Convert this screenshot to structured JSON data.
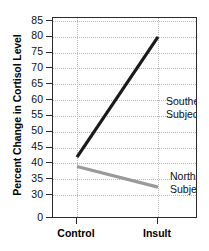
{
  "chart_data": {
    "type": "line",
    "title": "",
    "xlabel": "",
    "ylabel": "Percent Change in Cortisol Level",
    "categories": [
      "Control",
      "Insult"
    ],
    "series": [
      {
        "name": "Southern Subjects",
        "values": [
          42,
          80
        ],
        "color": "#1a1a1a"
      },
      {
        "name": "Northern Subjects",
        "values": [
          39,
          32.5
        ],
        "color": "#9a9a9a"
      }
    ],
    "ylim": [
      30,
      85
    ],
    "y_axis_broken": true,
    "y_tick_labels": [
      "0",
      "30",
      "35",
      "40",
      "45",
      "50",
      "55",
      "60",
      "65",
      "70",
      "75",
      "80",
      "85"
    ],
    "y_tick_values": [
      0,
      30,
      35,
      40,
      45,
      50,
      55,
      60,
      65,
      70,
      75,
      80,
      85
    ],
    "grid": "dotted-both",
    "legend_position": "in-plot-annotations",
    "annotations": [
      {
        "name": "southern-label",
        "line1": "Southern",
        "line2": "Subjects"
      },
      {
        "name": "northern-label",
        "line1": "Northern",
        "line2": "Subjects"
      }
    ]
  },
  "axes": {
    "y": {
      "label": "Percent Change in Cortisol Level",
      "ticks": [
        {
          "label": "85",
          "value": 85
        },
        {
          "label": "80",
          "value": 80
        },
        {
          "label": "75",
          "value": 75
        },
        {
          "label": "70",
          "value": 70
        },
        {
          "label": "65",
          "value": 65
        },
        {
          "label": "60",
          "value": 60
        },
        {
          "label": "55",
          "value": 55
        },
        {
          "label": "50",
          "value": 50
        },
        {
          "label": "45",
          "value": 45
        },
        {
          "label": "40",
          "value": 40
        },
        {
          "label": "35",
          "value": 35
        },
        {
          "label": "30",
          "value": 30
        },
        {
          "label": "0",
          "value": 0
        }
      ]
    },
    "x": {
      "label": "",
      "ticks": [
        {
          "label": "Control"
        },
        {
          "label": "Insult"
        }
      ]
    }
  },
  "colors": {
    "southern_line": "#1a1a1a",
    "northern_line": "#9a9a9a",
    "frame": "#2b2b2b",
    "grid": "#b9b9b9",
    "text": "#111111",
    "background": "#ffffff"
  }
}
